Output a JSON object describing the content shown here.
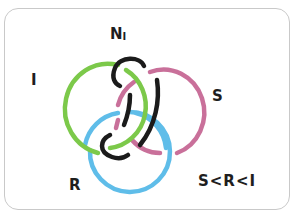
{
  "diagram": {
    "type": "hand-drawn link diagram",
    "labels": {
      "top": "N",
      "top_subscript": "I",
      "green_ring": "I",
      "pink_ring": "S",
      "blue_ring": "R",
      "ordering": "S<R<I"
    },
    "rings": [
      {
        "name": "I",
        "color": "#7cc94a"
      },
      {
        "name": "S",
        "color": "#c9709a"
      },
      {
        "name": "R",
        "color": "#5fbde9"
      },
      {
        "name": "N_I",
        "color": "#1b1b1b"
      }
    ],
    "border_color": "#c9c9c9"
  }
}
